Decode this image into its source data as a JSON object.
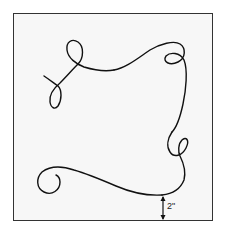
{
  "diagram": {
    "type": "decorative-scroll-line-template",
    "frame": {
      "stroke": "#333333",
      "fill": "#f7f7f7"
    },
    "line_color": "#111111",
    "measurement": {
      "label": "2\"",
      "description": "gap between curve bottom and frame edge"
    }
  }
}
